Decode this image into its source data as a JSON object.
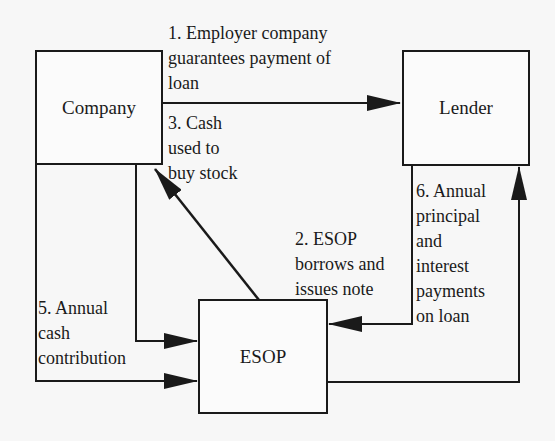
{
  "nodes": {
    "company": "Company",
    "lender": "Lender",
    "esop": "ESOP"
  },
  "edges": [
    {
      "id": 1,
      "from": "Company",
      "to": "Lender",
      "label": "1. Employer company\nguarantees payment of\nloan"
    },
    {
      "id": 2,
      "from": "Lender",
      "to": "ESOP",
      "label": "2. ESOP\nborrows and\nissues note"
    },
    {
      "id": 3,
      "from": "ESOP",
      "to": "Company",
      "label": "3. Cash\nused to\nbuy stock"
    },
    {
      "id": 4,
      "from": "Company",
      "to": "ESOP",
      "label": ""
    },
    {
      "id": 5,
      "from": "Company",
      "to": "ESOP",
      "label": "5. Annual\ncash\ncontribution"
    },
    {
      "id": 6,
      "from": "ESOP",
      "to": "Lender",
      "label": "6. Annual\nprincipal\nand\ninterest\npayments\non loan"
    }
  ],
  "colors": {
    "line": "#1a1a1a",
    "background": "#f7f7f7"
  }
}
